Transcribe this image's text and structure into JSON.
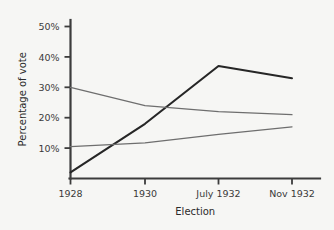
{
  "chart_data": {
    "type": "line",
    "title": "",
    "subtitle": "",
    "xlabel": "Election",
    "ylabel": "Percentage of vote",
    "categories": [
      "1928",
      "1930",
      "July 1932",
      "Nov 1932"
    ],
    "x": [
      0,
      1,
      2,
      3
    ],
    "ylim": [
      0,
      55
    ],
    "xlim": [
      -0.1,
      3.15
    ],
    "yticks": [
      10,
      20,
      30,
      40,
      50
    ],
    "ytick_labels": [
      "10%",
      "20%",
      "30%",
      "40%",
      "50%"
    ],
    "xtick_labels": [
      "1928",
      "1930",
      "July 1932",
      "Nov 1932"
    ],
    "grid": false,
    "legend": "none",
    "series": [
      {
        "name": "rising-steep-line",
        "color": "#262626",
        "width": 2.1,
        "values": [
          2,
          18,
          37,
          33
        ]
      },
      {
        "name": "declining-line",
        "color": "#6e6e6e",
        "width": 1.3,
        "values": [
          30,
          24,
          22,
          21
        ]
      },
      {
        "name": "slowly-rising-line",
        "color": "#6e6e6e",
        "width": 1.3,
        "values": [
          10.5,
          11.7,
          14.5,
          17
        ]
      }
    ],
    "axis_color": "#3c3c3c",
    "background_color": "#f6f6f4"
  }
}
